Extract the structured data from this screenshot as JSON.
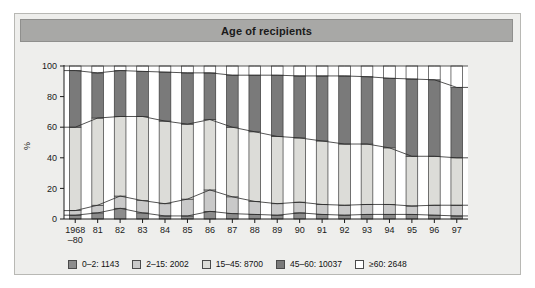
{
  "figure": {
    "title": "Age of recipients",
    "background_color": "#eeeeec",
    "title_bar_color": "#a8a8a6"
  },
  "chart_data": {
    "type": "area",
    "title": "Age of recipients",
    "xlabel": "",
    "ylabel": "%",
    "ylim": [
      0,
      100
    ],
    "yticks": [
      0,
      20,
      40,
      60,
      80,
      100
    ],
    "ytick_labels": [
      "0",
      "20",
      "40",
      "60",
      "80",
      "100"
    ],
    "grid": false,
    "legend_position": "bottom",
    "stacked": true,
    "stack_order_bottom_to_top": [
      "0-2",
      "2-15",
      "15-45",
      "45-60",
      ">=60"
    ],
    "categories": [
      "1968–80",
      "81",
      "82",
      "83",
      "84",
      "85",
      "86",
      "87",
      "88",
      "89",
      "90",
      "91",
      "92",
      "93",
      "94",
      "95",
      "96",
      "97"
    ],
    "category_labels_multiline": {
      "0": [
        "1968",
        "–80"
      ]
    },
    "series": [
      {
        "name": "0-2",
        "label": "0–2: 1143",
        "color": "#8c8c8c",
        "total": 1143,
        "values": [
          2.5,
          4.0,
          7.0,
          4.0,
          2.0,
          2.0,
          5.0,
          3.5,
          3.0,
          2.5,
          4.0,
          3.0,
          2.5,
          3.0,
          3.0,
          3.0,
          2.5,
          2.0
        ]
      },
      {
        "name": "2-15",
        "label": "2–15: 2002",
        "color": "#c9c9c9",
        "total": 2002,
        "values": [
          3.0,
          5.0,
          8.0,
          8.0,
          8.0,
          11.0,
          14.0,
          11.0,
          8.5,
          7.5,
          7.0,
          6.5,
          6.5,
          6.5,
          6.5,
          5.5,
          6.5,
          7.0
        ]
      },
      {
        "name": "15-45",
        "label": "15–45: 8700",
        "color": "#dcdcd8",
        "total": 8700,
        "values": [
          54.5,
          57.0,
          52.0,
          55.0,
          54.0,
          49.0,
          46.0,
          45.5,
          45.5,
          44.0,
          42.0,
          41.5,
          40.0,
          39.5,
          37.0,
          32.5,
          32.0,
          31.0
        ]
      },
      {
        "name": "45-60",
        "label": "45–60: 10037",
        "color": "#7a7a7a",
        "total": 10037,
        "values": [
          37.0,
          29.5,
          30.0,
          29.5,
          32.0,
          33.5,
          30.5,
          34.0,
          37.0,
          40.0,
          40.5,
          42.5,
          44.5,
          44.0,
          45.5,
          50.5,
          50.0,
          46.0
        ]
      },
      {
        "name": ">=60",
        "label": "≥60: 2648",
        "color": "#ffffff",
        "total": 2648,
        "values": [
          3.0,
          4.5,
          3.0,
          3.5,
          4.0,
          4.5,
          4.5,
          6.0,
          6.0,
          6.0,
          6.5,
          6.5,
          6.5,
          7.0,
          8.0,
          8.5,
          9.0,
          14.0
        ]
      }
    ]
  },
  "legend": {
    "items": [
      {
        "label": "0–2: 1143",
        "color": "#8c8c8c"
      },
      {
        "label": "2–15: 2002",
        "color": "#c9c9c9"
      },
      {
        "label": "15–45: 8700",
        "color": "#dcdcd8"
      },
      {
        "label": "45–60: 10037",
        "color": "#7a7a7a"
      },
      {
        "label": "≥60: 2648",
        "color": "#ffffff"
      }
    ]
  }
}
